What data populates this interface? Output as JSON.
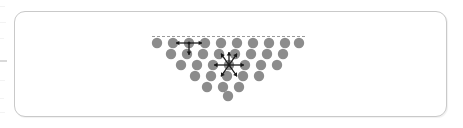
{
  "figure": {
    "name": "surface-tension-molecular-forces",
    "title": "",
    "caption": "",
    "background_color": "#ffffff",
    "panel": {
      "border_color": "#c9c9c9",
      "fill_color": "#ffffff",
      "corner_radius": 11,
      "x": 14,
      "y": 11,
      "width": 433,
      "height": 106
    }
  },
  "chart_data": {
    "type": "scatter",
    "title": "",
    "subtitle": "",
    "xlabel": "",
    "ylabel": "",
    "grid": false,
    "legend_position": "none",
    "annotations": [],
    "tick_labels": {
      "x": [],
      "y": []
    },
    "molecule_color": "#8c8c8c",
    "molecule_radius": 5.2,
    "surface_line": {
      "name": "liquid-surface",
      "color": "#9a9a9a",
      "dash": "3 2",
      "x1": 152,
      "y1": 36.5,
      "x2": 305,
      "y2": 36.5
    },
    "rows": [
      {
        "row": 1,
        "cy": 43,
        "cx": [
          157,
          173,
          189,
          205,
          221,
          237,
          253,
          269,
          285,
          299
        ]
      },
      {
        "row": 2,
        "cy": 54,
        "cx": [
          171,
          187,
          203,
          219,
          235,
          251,
          267,
          283
        ]
      },
      {
        "row": 3,
        "cy": 65,
        "cx": [
          181,
          197,
          213,
          229,
          245,
          261,
          277
        ]
      },
      {
        "row": 4,
        "cy": 76,
        "cx": [
          195,
          211,
          227,
          243,
          259
        ]
      },
      {
        "row": 5,
        "cy": 87,
        "cx": [
          207,
          223,
          239
        ]
      },
      {
        "row": 6,
        "cy": 96,
        "cx": [
          228
        ]
      }
    ],
    "force_systems": [
      {
        "name": "surface-molecule-forces",
        "label": "",
        "description": "unbalanced cohesive forces on a surface molecule",
        "center": {
          "x": 189,
          "y": 43
        },
        "net_force": "downward",
        "arrow_color": "#171717",
        "arrows": [
          {
            "angle_deg": 180,
            "length": 13
          },
          {
            "angle_deg": 0,
            "length": 13
          },
          {
            "angle_deg": 270,
            "length": 12
          }
        ]
      },
      {
        "name": "interior-molecule-forces",
        "label": "",
        "description": "balanced cohesive forces on an interior molecule",
        "center": {
          "x": 229,
          "y": 65
        },
        "net_force": "zero",
        "arrow_color": "#171717",
        "arrows": [
          {
            "angle_deg": 180,
            "length": 15
          },
          {
            "angle_deg": 0,
            "length": 15
          },
          {
            "angle_deg": 55,
            "length": 14
          },
          {
            "angle_deg": 125,
            "length": 14
          },
          {
            "angle_deg": 235,
            "length": 14
          },
          {
            "angle_deg": 305,
            "length": 14
          },
          {
            "angle_deg": 90,
            "length": 13
          }
        ]
      }
    ]
  }
}
